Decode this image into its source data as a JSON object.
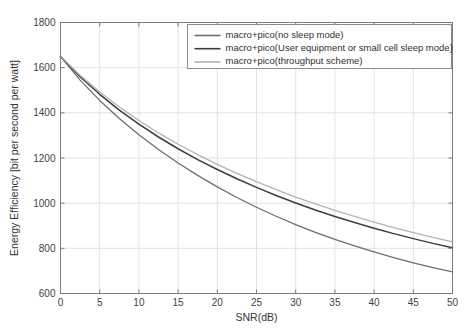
{
  "chart_data": {
    "type": "line",
    "title": "",
    "xlabel": "SNR(dB)",
    "ylabel": "Energy Efficiency [bit per second per watt]",
    "xlim": [
      0,
      50
    ],
    "ylim": [
      600,
      1800
    ],
    "xticks": [
      0,
      5,
      10,
      15,
      20,
      25,
      30,
      35,
      40,
      45,
      50
    ],
    "yticks": [
      600,
      800,
      1000,
      1200,
      1400,
      1600,
      1800
    ],
    "grid": true,
    "legend_position": "top-right",
    "x": [
      0,
      2.5,
      5,
      7.5,
      10,
      12.5,
      15,
      17.5,
      20,
      22.5,
      25,
      27.5,
      30,
      32.5,
      35,
      37.5,
      40,
      42.5,
      45,
      47.5,
      50
    ],
    "series": [
      {
        "name": "macro+pico(no sleep mode)",
        "color": "#6e6e6e",
        "values": [
          1650,
          1545,
          1455,
          1375,
          1303,
          1238,
          1178,
          1123,
          1072,
          1025,
          982,
          942,
          905,
          871,
          840,
          811,
          784,
          759,
          736,
          715,
          696
        ]
      },
      {
        "name": "macro+pico(User equipment or small cell sleep mode)",
        "color": "#3d3d3d",
        "values": [
          1650,
          1560,
          1482,
          1412,
          1350,
          1293,
          1241,
          1193,
          1149,
          1108,
          1070,
          1034,
          1001,
          970,
          941,
          914,
          889,
          865,
          843,
          822,
          803
        ]
      },
      {
        "name": "macro+pico(throughput scheme)",
        "color": "#b4b4b4",
        "values": [
          1650,
          1566,
          1492,
          1426,
          1366,
          1311,
          1261,
          1215,
          1172,
          1132,
          1095,
          1060,
          1027,
          997,
          968,
          941,
          916,
          892,
          870,
          849,
          829
        ]
      }
    ]
  }
}
